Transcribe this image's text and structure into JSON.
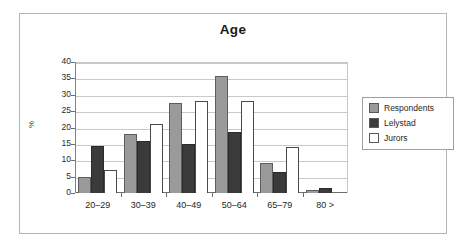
{
  "chart_data": {
    "type": "bar",
    "title": "Age",
    "xlabel": "",
    "ylabel": "%",
    "ylim": [
      0,
      40
    ],
    "yticks": [
      0,
      5,
      10,
      15,
      20,
      25,
      30,
      35,
      40
    ],
    "grid": true,
    "legend_position": "right",
    "categories": [
      "20–29",
      "30–39",
      "40–49",
      "50–64",
      "65–79",
      "80 >"
    ],
    "series": [
      {
        "name": "Respondents",
        "color": "#9a9a9a",
        "values": [
          5,
          18,
          27.5,
          35.7,
          9.3,
          1
        ]
      },
      {
        "name": "Lelystad",
        "color": "#3b3b3b",
        "values": [
          14.5,
          16,
          15,
          18.5,
          6.3,
          1.5
        ]
      },
      {
        "name": "Jurors",
        "color": "#ffffff",
        "values": [
          7,
          21,
          28.2,
          28.1,
          14,
          0
        ]
      }
    ]
  },
  "legend": {
    "items": [
      {
        "label": "Respondents",
        "swatch": "#9a9a9a"
      },
      {
        "label": "Lelystad",
        "swatch": "#3b3b3b"
      },
      {
        "label": "Jurors",
        "swatch": "#ffffff"
      }
    ]
  },
  "colors": {
    "respondents": "#9a9a9a",
    "lelystad": "#3b3b3b",
    "jurors": "#ffffff",
    "gridline": "#c9c9c9",
    "axis": "#6e6e6e",
    "frame": "#b4b4b4"
  }
}
